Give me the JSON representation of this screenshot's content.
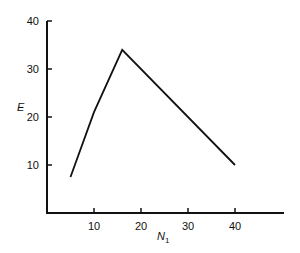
{
  "chart_data": {
    "type": "line",
    "title": "",
    "xlabel": "N",
    "xlabel_subscript": "1",
    "ylabel": "E",
    "x_ticks": [
      10,
      20,
      30,
      40
    ],
    "y_ticks": [
      10,
      20,
      30,
      40
    ],
    "xlim": [
      0,
      50
    ],
    "ylim": [
      0,
      40
    ],
    "grid": false,
    "legend": null,
    "series": [
      {
        "name": "E",
        "x": [
          5,
          10,
          16,
          40
        ],
        "y": [
          7.5,
          21,
          34,
          10
        ]
      }
    ],
    "colors": {
      "line": "#111111",
      "axis": "#111111",
      "background": "#ffffff"
    }
  }
}
